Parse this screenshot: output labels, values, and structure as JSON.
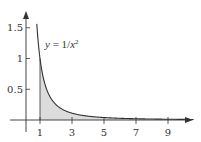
{
  "chart_data": {
    "type": "area",
    "title": "",
    "function": "y = 1/x^2",
    "annotation": "y = 1/x²",
    "xlabel": "",
    "ylabel": "",
    "x_ticks": [
      1,
      3,
      5,
      7,
      9
    ],
    "x_tick_labels": [
      "1",
      "3",
      "5",
      "7",
      "9"
    ],
    "y_ticks": [
      0.5,
      1,
      1.5
    ],
    "y_tick_labels": [
      "0.5",
      "1",
      "1.5"
    ],
    "xlim": [
      0,
      10.5
    ],
    "ylim": [
      0,
      1.7
    ],
    "shaded_region": {
      "from_x": 1,
      "to_x": "infinity",
      "description": "area under y=1/x^2 for x >= 1"
    },
    "curve_start_x": 0.8,
    "series": [
      {
        "name": "y = 1/x^2",
        "x": [
          0.82,
          1,
          1.5,
          2,
          3,
          4,
          5,
          6,
          7,
          8,
          9,
          10
        ],
        "y": [
          1.487,
          1,
          0.444,
          0.25,
          0.111,
          0.0625,
          0.04,
          0.0278,
          0.0204,
          0.0156,
          0.0123,
          0.01
        ]
      }
    ],
    "grid": false,
    "legend": null
  },
  "colors": {
    "axis": "#333333",
    "curve": "#333333",
    "shade": "#dcdcdc"
  }
}
